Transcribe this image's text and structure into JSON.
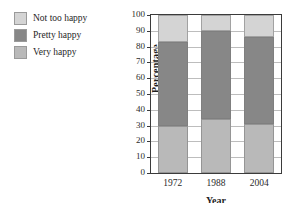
{
  "chart_data": {
    "type": "bar",
    "stacked": true,
    "title": "",
    "xlabel": "Year",
    "ylabel": "Percentage",
    "categories": [
      "1972",
      "1988",
      "2004"
    ],
    "ylim": [
      0,
      100
    ],
    "yticks": [
      0,
      10,
      20,
      30,
      40,
      50,
      60,
      70,
      80,
      90,
      100
    ],
    "grid": true,
    "legend_position": "top-left-outside",
    "series": [
      {
        "name": "Not too happy",
        "color": "#d4d4d4",
        "values": [
          17,
          10,
          14
        ]
      },
      {
        "name": "Pretty happy",
        "color": "#878787",
        "values": [
          53,
          56,
          55
        ]
      },
      {
        "name": "Very happy",
        "color": "#b9b9b9",
        "values": [
          30,
          34,
          31
        ]
      }
    ],
    "stack_order_bottom_to_top": [
      "Very happy",
      "Pretty happy",
      "Not too happy"
    ]
  },
  "legend": {
    "items": [
      {
        "label": "Not too happy",
        "color": "#d4d4d4"
      },
      {
        "label": "Pretty happy",
        "color": "#878787"
      },
      {
        "label": "Very happy",
        "color": "#b9b9b9"
      }
    ]
  },
  "axes": {
    "y_title": "Percentage",
    "x_title": "Year",
    "y_tick_labels": [
      "100",
      "90",
      "80",
      "70",
      "60",
      "50",
      "40",
      "30",
      "20",
      "10",
      "0"
    ],
    "x_tick_labels": [
      "1972",
      "1988",
      "2004"
    ]
  }
}
